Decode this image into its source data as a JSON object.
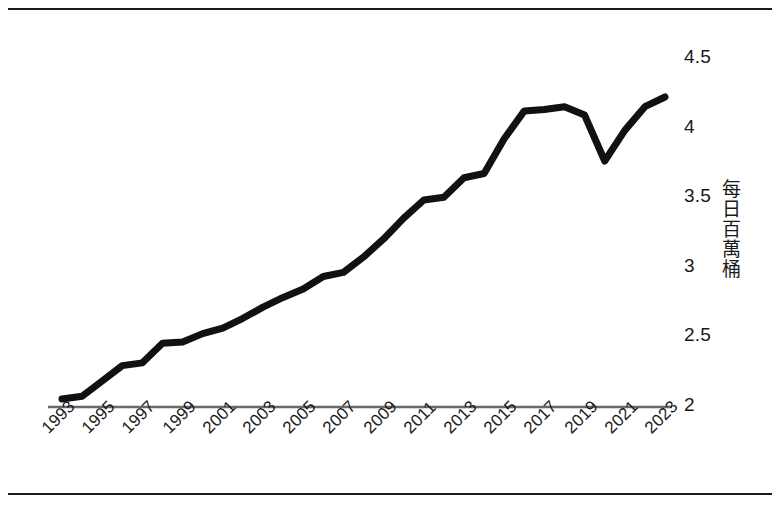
{
  "chart_data": {
    "type": "line",
    "title": "",
    "subtitle": "",
    "xlabel": "",
    "ylabel": "每日百萬桶",
    "ylabel_orientation": "vertical-cjk",
    "xlim": [
      1993,
      2023
    ],
    "ylim": [
      2,
      4.5
    ],
    "yticks": [
      2,
      2.5,
      3,
      3.5,
      4,
      4.5
    ],
    "ytick_labels": [
      "2",
      "2.5",
      "3",
      "3.5",
      "4",
      "4.5"
    ],
    "ytick_side": "right",
    "xticks": [
      1993,
      1995,
      1997,
      1999,
      2001,
      2003,
      2005,
      2007,
      2009,
      2011,
      2013,
      2015,
      2017,
      2019,
      2021,
      2023
    ],
    "xtick_labels": [
      "1993",
      "1995",
      "1997",
      "1999",
      "2001",
      "2003",
      "2005",
      "2007",
      "2009",
      "2011",
      "2013",
      "2015",
      "2017",
      "2019",
      "2021",
      "2023"
    ],
    "xtick_rotation": -45,
    "grid": false,
    "legend": false,
    "legend_position": "none",
    "line_color": "#111111",
    "line_width": 7,
    "axis_color": "#555555",
    "background": "#ffffff",
    "x": [
      1993,
      1994,
      1995,
      1996,
      1997,
      1998,
      1999,
      2000,
      2001,
      2002,
      2003,
      2004,
      2005,
      2006,
      2007,
      2008,
      2009,
      2010,
      2011,
      2012,
      2013,
      2014,
      2015,
      2016,
      2017,
      2018,
      2019,
      2020,
      2021,
      2022,
      2023
    ],
    "series": [
      {
        "name": "每日百萬桶",
        "values": [
          2.05,
          2.07,
          2.18,
          2.29,
          2.31,
          2.45,
          2.46,
          2.52,
          2.56,
          2.63,
          2.71,
          2.78,
          2.84,
          2.93,
          2.96,
          3.07,
          3.2,
          3.35,
          3.48,
          3.5,
          3.64,
          3.67,
          3.92,
          4.12,
          4.13,
          4.15,
          4.09,
          3.76,
          3.98,
          4.15,
          4.22
        ]
      }
    ],
    "annotations": []
  },
  "frame": {
    "top_rule": "horizontal-rule",
    "bottom_rule": "horizontal-rule"
  }
}
